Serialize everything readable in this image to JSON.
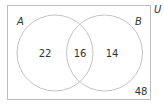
{
  "diagram": {
    "type": "venn",
    "universe_label": "U",
    "sets": [
      {
        "label": "A",
        "only_count": "22"
      },
      {
        "label": "B",
        "only_count": "14"
      }
    ],
    "intersection_count": "16",
    "outside_count": "48",
    "colors": {
      "stroke": "#bdbdbd",
      "text": "#333333",
      "background": "#ffffff"
    }
  }
}
